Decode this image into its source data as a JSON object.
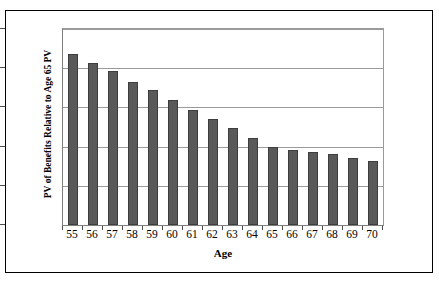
{
  "chart_data": {
    "type": "bar",
    "title": "",
    "xlabel": "Age",
    "ylabel": "PV of Benefits Relative to Age 65 PV",
    "categories": [
      "55",
      "56",
      "57",
      "58",
      "59",
      "60",
      "61",
      "62",
      "63",
      "64",
      "65",
      "66",
      "67",
      "68",
      "69",
      "70"
    ],
    "values": [
      2.18,
      2.07,
      1.96,
      1.83,
      1.72,
      1.6,
      1.47,
      1.35,
      1.24,
      1.11,
      1.0,
      0.96,
      0.93,
      0.9,
      0.86,
      0.82
    ],
    "ylim": [
      0.0,
      2.5
    ],
    "y_ticks": [
      "0.0",
      "0.5",
      "1.0",
      "1.5",
      "2.0",
      "2.5"
    ],
    "y_tick_values": [
      0.0,
      0.5,
      1.0,
      1.5,
      2.0,
      2.5
    ],
    "grid": true,
    "legend": "none",
    "bar_color": "#595959",
    "bar_border_color": "#3d3d3d",
    "gridline_color": "#9a9a9a",
    "axis_color": "#808080",
    "frame_color": "#000000",
    "background_color": "#ffffff"
  }
}
